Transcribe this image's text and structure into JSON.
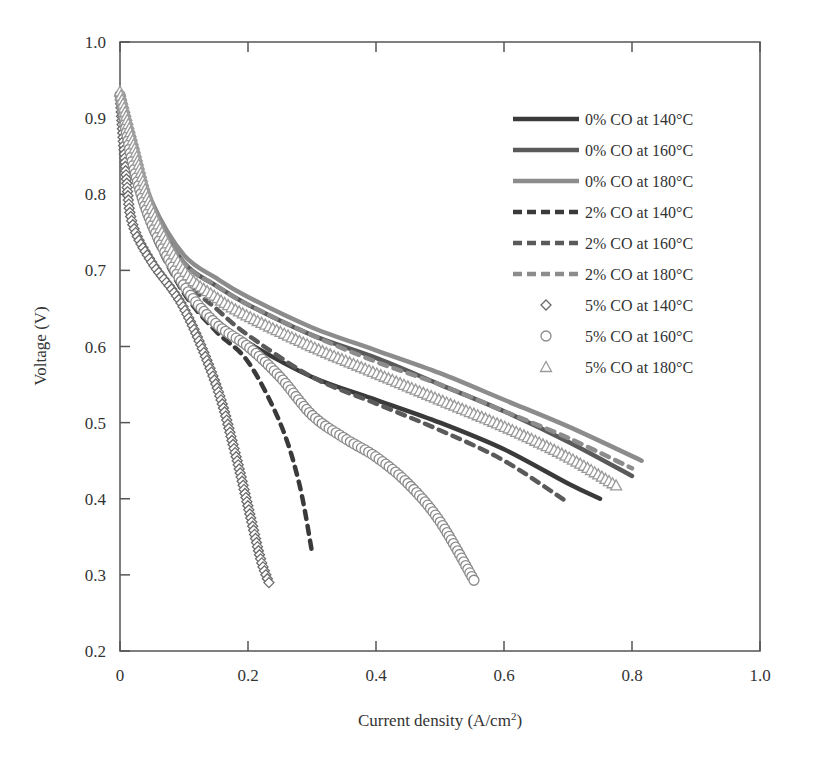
{
  "chart_data": {
    "type": "line",
    "title": "",
    "xlabel": "Current density (A/cm2)",
    "xlabel_main": "Current density (A/cm",
    "xlabel_sup": "2",
    "xlabel_close": ")",
    "ylabel": "Voltage (V)",
    "xlim": [
      0,
      1.0
    ],
    "ylim": [
      0.2,
      1.0
    ],
    "xticks": [
      "0",
      "0.2",
      "0.4",
      "0.6",
      "0.8",
      "1.0"
    ],
    "yticks": [
      "0.2",
      "0.3",
      "0.4",
      "0.5",
      "0.6",
      "0.7",
      "0.8",
      "0.9",
      "1.0"
    ],
    "grid": false,
    "legend_position": "upper right (inside)",
    "note": "Point values are approximate readings digitized from the rendered figure; curves are smooth traces between these points.",
    "series": [
      {
        "name": "0% CO at 140°C",
        "style": "solid",
        "color": "#3a3a3a",
        "x": [
          0.0,
          0.02,
          0.05,
          0.1,
          0.15,
          0.2,
          0.3,
          0.4,
          0.5,
          0.6,
          0.7,
          0.75
        ],
        "y": [
          0.93,
          0.84,
          0.76,
          0.68,
          0.635,
          0.605,
          0.56,
          0.53,
          0.5,
          0.465,
          0.42,
          0.4
        ]
      },
      {
        "name": "0% CO at 160°C",
        "style": "solid",
        "color": "#5a5a5a",
        "x": [
          0.0,
          0.02,
          0.05,
          0.1,
          0.15,
          0.2,
          0.3,
          0.4,
          0.5,
          0.6,
          0.7,
          0.8
        ],
        "y": [
          0.93,
          0.86,
          0.78,
          0.71,
          0.68,
          0.655,
          0.615,
          0.585,
          0.55,
          0.515,
          0.475,
          0.43
        ]
      },
      {
        "name": "0% CO at 180°C",
        "style": "solid",
        "color": "#8c8c8c",
        "x": [
          0.0,
          0.02,
          0.05,
          0.1,
          0.15,
          0.2,
          0.3,
          0.4,
          0.5,
          0.6,
          0.7,
          0.815
        ],
        "y": [
          0.935,
          0.87,
          0.79,
          0.72,
          0.69,
          0.665,
          0.625,
          0.595,
          0.565,
          0.53,
          0.495,
          0.45
        ]
      },
      {
        "name": "2% CO at 140°C",
        "style": "dashed",
        "color": "#3a3a3a",
        "x": [
          0.0,
          0.02,
          0.05,
          0.1,
          0.15,
          0.2,
          0.25,
          0.28,
          0.3
        ],
        "y": [
          0.93,
          0.83,
          0.75,
          0.67,
          0.62,
          0.58,
          0.5,
          0.42,
          0.33
        ]
      },
      {
        "name": "2% CO at 160°C",
        "style": "dashed",
        "color": "#5a5a5a",
        "x": [
          0.0,
          0.02,
          0.05,
          0.1,
          0.15,
          0.2,
          0.3,
          0.4,
          0.5,
          0.6,
          0.7
        ],
        "y": [
          0.93,
          0.85,
          0.77,
          0.69,
          0.65,
          0.615,
          0.56,
          0.525,
          0.49,
          0.45,
          0.395
        ]
      },
      {
        "name": "2% CO at 180°C",
        "style": "dashed",
        "color": "#8c8c8c",
        "x": [
          0.0,
          0.02,
          0.05,
          0.1,
          0.15,
          0.2,
          0.3,
          0.4,
          0.5,
          0.6,
          0.7,
          0.8
        ],
        "y": [
          0.935,
          0.865,
          0.785,
          0.71,
          0.68,
          0.655,
          0.615,
          0.58,
          0.55,
          0.515,
          0.48,
          0.44
        ]
      },
      {
        "name": "5% CO at 140°C",
        "style": "markers-diamond",
        "color": "#6a6a6a",
        "x": [
          0.0,
          0.01,
          0.02,
          0.05,
          0.1,
          0.15,
          0.18,
          0.2,
          0.22,
          0.235
        ],
        "y": [
          0.93,
          0.82,
          0.76,
          0.71,
          0.65,
          0.55,
          0.46,
          0.39,
          0.32,
          0.285
        ]
      },
      {
        "name": "5% CO at 160°C",
        "style": "markers-circle",
        "color": "#8a8a8a",
        "x": [
          0.0,
          0.02,
          0.05,
          0.1,
          0.15,
          0.2,
          0.25,
          0.3,
          0.35,
          0.4,
          0.45,
          0.5,
          0.555
        ],
        "y": [
          0.93,
          0.84,
          0.76,
          0.68,
          0.63,
          0.6,
          0.56,
          0.51,
          0.48,
          0.455,
          0.42,
          0.37,
          0.29
        ]
      },
      {
        "name": "5% CO at 180°C",
        "style": "markers-triangle",
        "color": "#9a9a9a",
        "x": [
          0.0,
          0.02,
          0.05,
          0.1,
          0.15,
          0.2,
          0.3,
          0.4,
          0.5,
          0.6,
          0.7,
          0.78
        ],
        "y": [
          0.935,
          0.87,
          0.78,
          0.7,
          0.665,
          0.64,
          0.6,
          0.565,
          0.53,
          0.495,
          0.455,
          0.415
        ]
      }
    ]
  },
  "legend": {
    "items": [
      {
        "label": "0% CO at 140°C"
      },
      {
        "label": "0% CO at 160°C"
      },
      {
        "label": "0% CO at 180°C"
      },
      {
        "label": "2% CO at 140°C"
      },
      {
        "label": "2% CO at 160°C"
      },
      {
        "label": "2% CO at 180°C"
      },
      {
        "label": "5% CO at 140°C"
      },
      {
        "label": "5% CO at 160°C"
      },
      {
        "label": "5% CO at 180°C"
      }
    ]
  }
}
